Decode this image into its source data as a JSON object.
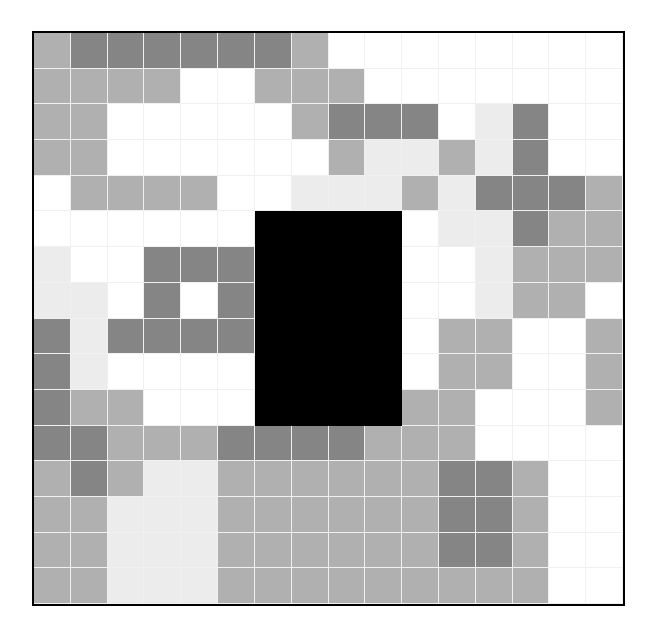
{
  "figure": {
    "background_color": "#ffffff",
    "border_color": "#000000",
    "gridline_color": "#f0f0f0",
    "plot_left_px": 32,
    "plot_top_px": 31,
    "plot_width_px": 593,
    "plot_height_px": 575
  },
  "chart_data": {
    "type": "heatmap",
    "title": "",
    "subtitle": "",
    "xlabel": "",
    "ylabel": "",
    "xlim": [
      0,
      16
    ],
    "ylim": [
      0,
      16
    ],
    "grid": true,
    "legend": null,
    "legend_position": "none",
    "n_cols": 16,
    "n_rows": 16,
    "colormap": "grays",
    "value_levels": [
      0,
      1,
      2,
      3
    ],
    "level_colors": [
      "#ffffff",
      "#ececec",
      "#b0b0b0",
      "#858585"
    ],
    "level_labels": [
      "white",
      "light-gray",
      "medium-gray",
      "dark-gray"
    ],
    "x_tick_labels": [],
    "y_tick_labels": [],
    "annotations": [
      {
        "name": "masked-black-rectangle",
        "color": "#000000",
        "col_start": 6,
        "col_end": 10,
        "row_start": 5,
        "row_end": 11
      }
    ],
    "values": [
      [
        2,
        3,
        3,
        3,
        3,
        3,
        3,
        2,
        0,
        0,
        0,
        0,
        0,
        0,
        0,
        0
      ],
      [
        2,
        2,
        2,
        2,
        0,
        0,
        2,
        2,
        2,
        0,
        0,
        0,
        0,
        0,
        0,
        0
      ],
      [
        2,
        2,
        0,
        0,
        0,
        0,
        0,
        2,
        3,
        3,
        3,
        0,
        1,
        3,
        0,
        0
      ],
      [
        2,
        2,
        0,
        0,
        0,
        0,
        0,
        0,
        2,
        1,
        1,
        2,
        1,
        3,
        0,
        0
      ],
      [
        0,
        2,
        2,
        2,
        2,
        0,
        0,
        1,
        1,
        1,
        2,
        1,
        3,
        3,
        3,
        2
      ],
      [
        0,
        0,
        0,
        0,
        0,
        0,
        1,
        1,
        1,
        1,
        0,
        1,
        1,
        3,
        2,
        2
      ],
      [
        1,
        0,
        0,
        3,
        3,
        3,
        0,
        0,
        0,
        0,
        0,
        0,
        1,
        2,
        2,
        2
      ],
      [
        1,
        1,
        0,
        3,
        0,
        3,
        0,
        0,
        0,
        0,
        0,
        0,
        1,
        2,
        2,
        0
      ],
      [
        3,
        1,
        3,
        3,
        3,
        3,
        0,
        0,
        0,
        0,
        0,
        2,
        2,
        0,
        0,
        2
      ],
      [
        3,
        1,
        0,
        0,
        0,
        0,
        0,
        0,
        0,
        0,
        0,
        2,
        2,
        0,
        0,
        2
      ],
      [
        3,
        2,
        2,
        0,
        0,
        0,
        0,
        0,
        0,
        0,
        2,
        2,
        0,
        0,
        0,
        2
      ],
      [
        3,
        3,
        2,
        2,
        2,
        3,
        3,
        3,
        3,
        2,
        2,
        2,
        0,
        0,
        0,
        0
      ],
      [
        2,
        3,
        2,
        1,
        1,
        2,
        2,
        2,
        2,
        2,
        2,
        3,
        3,
        2,
        0,
        0
      ],
      [
        2,
        2,
        1,
        1,
        1,
        2,
        2,
        2,
        2,
        2,
        2,
        3,
        3,
        2,
        0,
        0
      ],
      [
        2,
        2,
        1,
        1,
        1,
        2,
        2,
        2,
        2,
        2,
        2,
        3,
        3,
        2,
        0,
        0
      ],
      [
        2,
        2,
        1,
        1,
        1,
        2,
        2,
        2,
        2,
        2,
        2,
        2,
        2,
        2,
        0,
        0
      ]
    ]
  }
}
